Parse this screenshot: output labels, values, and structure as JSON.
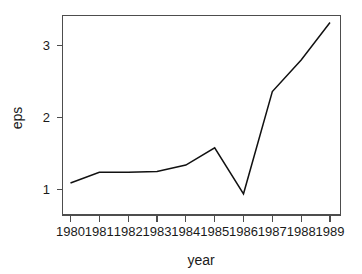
{
  "chart_data": {
    "type": "line",
    "title": "",
    "xlabel": "year",
    "ylabel": "eps",
    "x": [
      1980,
      1981,
      1982,
      1983,
      1984,
      1985,
      1986,
      1987,
      1988,
      1989
    ],
    "categories": [
      "1980",
      "1981",
      "1982",
      "1983",
      "1984",
      "1985",
      "1986",
      "1987",
      "1988",
      "1989"
    ],
    "values": [
      1.09,
      1.24,
      1.24,
      1.25,
      1.34,
      1.58,
      0.94,
      2.36,
      2.8,
      3.32
    ],
    "series": [
      {
        "name": "eps",
        "values": [
          1.09,
          1.24,
          1.24,
          1.25,
          1.34,
          1.58,
          0.94,
          2.36,
          2.8,
          3.32
        ],
        "color": "#111111"
      }
    ],
    "xlim": [
      1979.7,
      1989.3
    ],
    "ylim": [
      0.85,
      3.45
    ],
    "ytick_labels": [
      "1",
      "2",
      "3"
    ],
    "ytick_values": [
      1,
      2,
      3
    ],
    "xtick_labels": [
      "1980",
      "1981",
      "1982",
      "1983",
      "1984",
      "1985",
      "1986",
      "1987",
      "1988",
      "1989"
    ],
    "grid": false,
    "legend": false,
    "legend_position": "none",
    "frame": "box",
    "line_color": "#111111",
    "axis_color": "#4d4d4d",
    "background": "#ffffff"
  },
  "axis": {
    "x_title": "year",
    "y_title": "eps",
    "y_ticks": [
      {
        "label": "3",
        "value": 3
      },
      {
        "label": "2",
        "value": 2
      },
      {
        "label": "1",
        "value": 1
      }
    ],
    "x_ticks": [
      {
        "label": "1980",
        "value": 1980
      },
      {
        "label": "1981",
        "value": 1981
      },
      {
        "label": "1982",
        "value": 1982
      },
      {
        "label": "1983",
        "value": 1983
      },
      {
        "label": "1984",
        "value": 1984
      },
      {
        "label": "1985",
        "value": 1985
      },
      {
        "label": "1986",
        "value": 1986
      },
      {
        "label": "1987",
        "value": 1987
      },
      {
        "label": "1988",
        "value": 1988
      },
      {
        "label": "1989",
        "value": 1989
      }
    ]
  }
}
